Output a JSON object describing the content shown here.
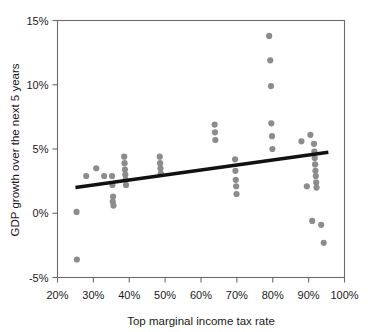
{
  "chart_data": {
    "type": "scatter",
    "title": "",
    "xlabel": "Top marginal income tax rate",
    "ylabel": "GDP growth over the next 5 years",
    "xlim": [
      20,
      100
    ],
    "ylim": [
      -5,
      15
    ],
    "grid": false,
    "legend": null,
    "x_ticks": [
      20,
      30,
      40,
      50,
      60,
      70,
      80,
      90,
      100
    ],
    "x_tick_labels": [
      "20%",
      "30%",
      "40%",
      "50%",
      "60%",
      "70%",
      "80%",
      "90%",
      "100%"
    ],
    "y_ticks": [
      -5,
      0,
      5,
      10,
      15
    ],
    "y_tick_labels": [
      "-5%",
      "0%",
      "5%",
      "10%",
      "15%"
    ],
    "point_color": "#8c8c8c",
    "point_radius": 3.1,
    "trendline": {
      "color": "#111111",
      "width": 3.4,
      "x_start": 25.0,
      "y_start": 2.0,
      "x_end": 95.5,
      "y_end": 4.75
    },
    "points": [
      {
        "x": 25.3,
        "y": 0.1
      },
      {
        "x": 25.4,
        "y": -3.6
      },
      {
        "x": 28.0,
        "y": 2.9
      },
      {
        "x": 30.8,
        "y": 3.5
      },
      {
        "x": 33.0,
        "y": 2.9
      },
      {
        "x": 35.2,
        "y": 2.9
      },
      {
        "x": 35.3,
        "y": 2.2
      },
      {
        "x": 35.4,
        "y": 0.9
      },
      {
        "x": 35.5,
        "y": 1.3
      },
      {
        "x": 35.6,
        "y": 0.6
      },
      {
        "x": 38.6,
        "y": 4.4
      },
      {
        "x": 38.7,
        "y": 3.9
      },
      {
        "x": 38.8,
        "y": 3.4
      },
      {
        "x": 38.9,
        "y": 3.0
      },
      {
        "x": 39.0,
        "y": 2.6
      },
      {
        "x": 39.1,
        "y": 2.2
      },
      {
        "x": 48.5,
        "y": 4.4
      },
      {
        "x": 48.6,
        "y": 3.9
      },
      {
        "x": 48.7,
        "y": 3.5
      },
      {
        "x": 48.8,
        "y": 3.1
      },
      {
        "x": 63.8,
        "y": 6.9
      },
      {
        "x": 63.9,
        "y": 6.3
      },
      {
        "x": 64.0,
        "y": 5.7
      },
      {
        "x": 69.5,
        "y": 4.2
      },
      {
        "x": 69.6,
        "y": 3.3
      },
      {
        "x": 69.7,
        "y": 2.6
      },
      {
        "x": 69.8,
        "y": 2.1
      },
      {
        "x": 69.9,
        "y": 1.5
      },
      {
        "x": 79.0,
        "y": 13.8
      },
      {
        "x": 79.3,
        "y": 11.9
      },
      {
        "x": 79.5,
        "y": 9.9
      },
      {
        "x": 79.6,
        "y": 7.0
      },
      {
        "x": 79.8,
        "y": 6.0
      },
      {
        "x": 79.9,
        "y": 5.0
      },
      {
        "x": 88.0,
        "y": 5.6
      },
      {
        "x": 90.5,
        "y": 6.1
      },
      {
        "x": 91.5,
        "y": 5.4
      },
      {
        "x": 91.6,
        "y": 4.8
      },
      {
        "x": 91.7,
        "y": 4.3
      },
      {
        "x": 91.8,
        "y": 3.8
      },
      {
        "x": 91.9,
        "y": 3.3
      },
      {
        "x": 92.0,
        "y": 2.9
      },
      {
        "x": 92.1,
        "y": 2.4
      },
      {
        "x": 92.2,
        "y": 2.0
      },
      {
        "x": 89.5,
        "y": 2.1
      },
      {
        "x": 91.0,
        "y": -0.6
      },
      {
        "x": 93.5,
        "y": -0.9
      },
      {
        "x": 94.2,
        "y": -2.3
      }
    ]
  }
}
